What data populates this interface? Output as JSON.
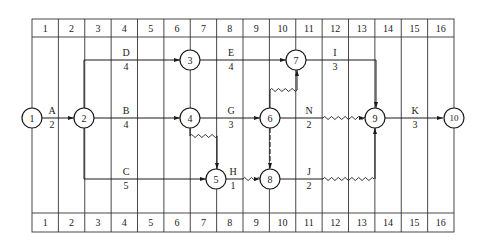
{
  "diagram": {
    "type": "time-scaled network diagram",
    "timeline": {
      "top_labels": [
        "1",
        "2",
        "3",
        "4",
        "5",
        "6",
        "7",
        "8",
        "9",
        "10",
        "11",
        "12",
        "13",
        "14",
        "15",
        "16"
      ],
      "bottom_labels": [
        "1",
        "2",
        "3",
        "4",
        "5",
        "6",
        "7",
        "8",
        "9",
        "10",
        "11",
        "12",
        "13",
        "14",
        "15",
        "16"
      ]
    },
    "nodes": [
      {
        "id": "1",
        "label": "1"
      },
      {
        "id": "2",
        "label": "2"
      },
      {
        "id": "3",
        "label": "3"
      },
      {
        "id": "4",
        "label": "4"
      },
      {
        "id": "5",
        "label": "5"
      },
      {
        "id": "6",
        "label": "6"
      },
      {
        "id": "7",
        "label": "7"
      },
      {
        "id": "8",
        "label": "8"
      },
      {
        "id": "9",
        "label": "9"
      },
      {
        "id": "10",
        "label": "10"
      }
    ],
    "activities": [
      {
        "name": "A",
        "duration": "2",
        "from": "1",
        "to": "2"
      },
      {
        "name": "D",
        "duration": "4",
        "from": "2",
        "to": "3"
      },
      {
        "name": "B",
        "duration": "4",
        "from": "2",
        "to": "4"
      },
      {
        "name": "C",
        "duration": "5",
        "from": "2",
        "to": "5"
      },
      {
        "name": "E",
        "duration": "4",
        "from": "3",
        "to": "7"
      },
      {
        "name": "G",
        "duration": "3",
        "from": "4",
        "to": "6"
      },
      {
        "name": "H",
        "duration": "1",
        "from": "5",
        "to": "8"
      },
      {
        "name": "I",
        "duration": "3",
        "from": "7",
        "to": "9"
      },
      {
        "name": "N",
        "duration": "2",
        "from": "6",
        "to": "9"
      },
      {
        "name": "J",
        "duration": "2",
        "from": "8",
        "to": "9"
      },
      {
        "name": "K",
        "duration": "3",
        "from": "9",
        "to": "10"
      }
    ],
    "dummies": [
      {
        "from": "4",
        "to": "5",
        "style": "wavy"
      },
      {
        "from": "6",
        "to": "7",
        "style": "wavy"
      },
      {
        "from": "6",
        "to": "8",
        "style": "dashed"
      }
    ]
  }
}
